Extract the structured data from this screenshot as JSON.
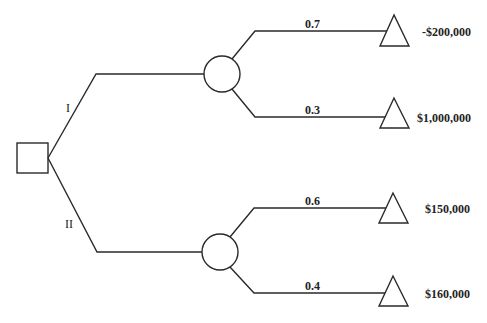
{
  "diagram": {
    "type": "decision-tree",
    "decision_node": {
      "shape": "square"
    },
    "branches": [
      {
        "label": "I",
        "chance_node": {
          "shape": "circle"
        },
        "outcomes": [
          {
            "probability": "0.7",
            "payoff": "-$200,000"
          },
          {
            "probability": "0.3",
            "payoff": "$1,000,000"
          }
        ]
      },
      {
        "label": "II",
        "chance_node": {
          "shape": "circle"
        },
        "outcomes": [
          {
            "probability": "0.6",
            "payoff": "$150,000"
          },
          {
            "probability": "0.4",
            "payoff": "$160,000"
          }
        ]
      }
    ]
  },
  "colors": {
    "line": "#2a2a2a",
    "background": "#ffffff"
  }
}
